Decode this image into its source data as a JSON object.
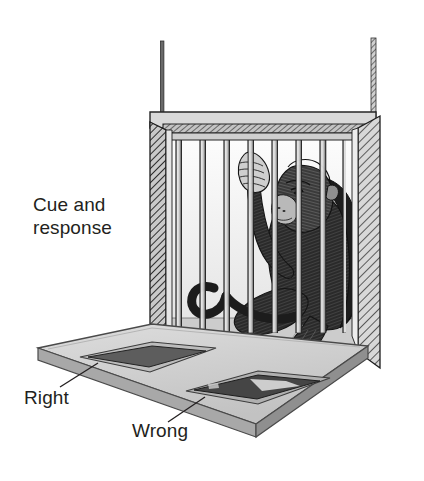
{
  "figure": {
    "background_color": "#ffffff",
    "ink_color": "#231f20"
  },
  "labels": {
    "cue_and_response": "Cue and\nresponse",
    "right": "Right",
    "wrong": "Wrong"
  },
  "scene": {
    "cage": {
      "name": "test cage",
      "bar_count": 8,
      "frame_color": "#d4d4d4",
      "shading_color": "#8c8c8c",
      "left_wall": "hatched cutaway",
      "right_wall": "hatched cutaway"
    },
    "platform": {
      "name": "response platform",
      "surface_color": "#cfcfcf",
      "edge_color": "#9a9a9a"
    },
    "panels": [
      {
        "name": "right-panel",
        "label_ref": "right",
        "fill_color": "#5d5d5d"
      },
      {
        "name": "wrong-panel",
        "label_ref": "wrong",
        "fill_color": "#454545"
      }
    ],
    "animal": {
      "name": "monkey",
      "posture": "seated, gripping bar with left hand, right hand on wrong panel",
      "fur_color": "#2b2b2b"
    }
  }
}
